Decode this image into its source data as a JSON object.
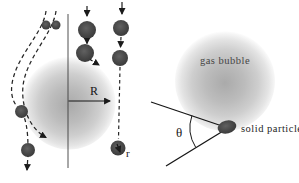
{
  "labels": {
    "bubble_radius": "R",
    "particle_radius": "r",
    "gas_bubble": "gas bubble",
    "solid_particle": "solid particle",
    "contact_angle": "θ"
  },
  "colors": {
    "background": "#ffffff",
    "bubble_gray_center": "#aeaeae",
    "bubble_gray_edge": "#e9e9e9",
    "particle_dark": "#454545",
    "line_ink": "#1b1b1b"
  }
}
